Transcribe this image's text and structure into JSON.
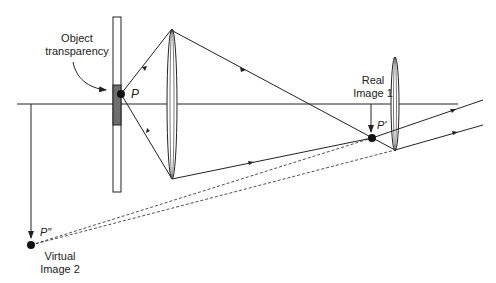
{
  "diagram": {
    "type": "optical-ray-diagram",
    "labels": {
      "object_line1": "Object",
      "object_line2": "transparency",
      "point_p": "P",
      "real_line1": "Real",
      "real_line2": "Image 1",
      "point_p_prime": "P'",
      "point_p_double_prime": "P\"",
      "virtual_line1": "Virtual",
      "virtual_line2": "Image 2"
    },
    "elements": [
      "optical-axis",
      "object-transparency",
      "lens-1",
      "lens-2",
      "real-image-1",
      "virtual-image-2"
    ],
    "colors": {
      "stroke": "#222222",
      "transparency_fill": "#6e6e6e",
      "background": "#ffffff"
    }
  }
}
